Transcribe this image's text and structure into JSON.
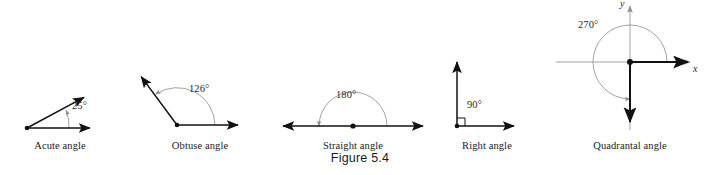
{
  "figure": {
    "caption": "Figure 5.4",
    "background_color": "#ffffff",
    "ray_color": "#111111",
    "arc_color": "#8c8c8c",
    "axis_color": "#8c8c8c",
    "text_color": "#1a1a1a"
  },
  "panels": [
    {
      "id": "acute",
      "label": "Acute angle",
      "angle_text": "25°",
      "angle_value": 25,
      "vertex": {
        "x": 27,
        "y": 128
      },
      "rays": [
        {
          "name": "initial-side",
          "to": {
            "x": 92,
            "y": 128
          }
        },
        {
          "name": "terminal-side",
          "to": {
            "x": 86,
            "y": 97
          }
        }
      ],
      "arc": {
        "cx": 27,
        "cy": 128,
        "r": 42,
        "start_deg": 0,
        "end_deg": 25
      },
      "angle_label_pos": {
        "x": 72,
        "y": 107
      },
      "label_pos": {
        "x": 60,
        "y": 141
      }
    },
    {
      "id": "obtuse",
      "label": "Obtuse angle",
      "angle_text": "126°",
      "angle_value": 126,
      "vertex": {
        "x": 177,
        "y": 125
      },
      "rays": [
        {
          "name": "initial-side",
          "to": {
            "x": 240,
            "y": 125
          }
        },
        {
          "name": "terminal-side",
          "to": {
            "x": 139,
            "y": 74
          }
        }
      ],
      "arc": {
        "cx": 177,
        "cy": 125,
        "r": 38,
        "start_deg": 0,
        "end_deg": 126
      },
      "angle_label_pos": {
        "x": 189,
        "y": 89
      },
      "label_pos": {
        "x": 200,
        "y": 141
      }
    },
    {
      "id": "straight",
      "label": "Straight angle",
      "angle_text": "180°",
      "angle_value": 180,
      "vertex": {
        "x": 353,
        "y": 126
      },
      "rays": [
        {
          "name": "initial-side",
          "to": {
            "x": 425,
            "y": 126
          }
        },
        {
          "name": "terminal-side",
          "to": {
            "x": 281,
            "y": 126
          }
        }
      ],
      "arc": {
        "cx": 353,
        "cy": 126,
        "r": 34,
        "start_deg": 0,
        "end_deg": 180
      },
      "angle_label_pos": {
        "x": 336,
        "y": 96
      },
      "label_pos": {
        "x": 353,
        "y": 141
      }
    },
    {
      "id": "right",
      "label": "Right angle",
      "angle_text": "90°",
      "angle_value": 90,
      "vertex": {
        "x": 457,
        "y": 126
      },
      "rays": [
        {
          "name": "initial-side",
          "to": {
            "x": 516,
            "y": 126
          }
        },
        {
          "name": "terminal-side",
          "to": {
            "x": 457,
            "y": 60
          }
        }
      ],
      "square_marker": {
        "size": 8
      },
      "angle_label_pos": {
        "x": 466,
        "y": 106
      },
      "label_pos": {
        "x": 487,
        "y": 141
      }
    },
    {
      "id": "quadrantal",
      "label": "Quadrantal angle",
      "angle_text": "270°",
      "angle_value": 270,
      "vertex": {
        "x": 630,
        "y": 62
      },
      "rays": [
        {
          "name": "initial-side",
          "to": {
            "x": 690,
            "y": 62
          }
        },
        {
          "name": "terminal-side",
          "to": {
            "x": 630,
            "y": 124
          }
        }
      ],
      "axes": {
        "x_label": "x",
        "y_label": "y",
        "x_from": {
          "x": 556,
          "y": 62
        },
        "x_to": {
          "x": 692,
          "y": 62
        },
        "y_from": {
          "x": 630,
          "y": 130
        },
        "y_to": {
          "x": 630,
          "y": 5
        },
        "x_label_pos": {
          "x": 693,
          "y": 64
        },
        "y_label_pos": {
          "x": 621,
          "y": 0
        }
      },
      "arc": {
        "cx": 630,
        "cy": 62,
        "r": 37,
        "start_deg": 0,
        "end_deg": 270
      },
      "angle_label_pos": {
        "x": 578,
        "y": 26
      },
      "label_pos": {
        "x": 630,
        "y": 141
      }
    }
  ]
}
